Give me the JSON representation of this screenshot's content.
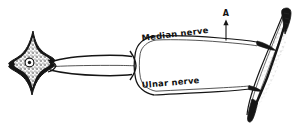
{
  "figure": {
    "background_color": "#ffffff",
    "ink_color": "#151515",
    "width": 296,
    "height": 137
  },
  "labels": {
    "median_nerve": "Median nerve",
    "ulnar_nerve": "Ulnar nerve",
    "marker_a": "A"
  },
  "parts": {
    "cell_body_name": "stellate-neuron-cell-body",
    "nucleus_name": "neuron-nucleus",
    "axon_name": "axon-trunk",
    "loop_name": "nerve-bifurcation-loop",
    "muscle_name": "spindle-muscle",
    "upper_branch_name": "median-nerve-branch",
    "lower_branch_name": "ulnar-nerve-branch",
    "marker_line_name": "marker-a-leader-line"
  }
}
